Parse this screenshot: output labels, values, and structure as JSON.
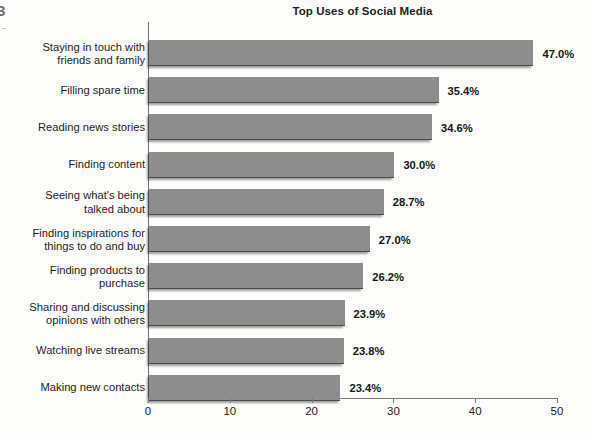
{
  "page": {
    "edge_artifact": "3",
    "background_color": "#fdfdfc"
  },
  "chart_data": {
    "type": "bar",
    "orientation": "horizontal",
    "title": "Top Uses of Social Media",
    "xlabel": "",
    "ylabel": "",
    "xlim": [
      0,
      50
    ],
    "xticks": [
      0,
      10,
      20,
      30,
      40,
      50
    ],
    "xtick_labels": [
      "0",
      "10",
      "20",
      "30",
      "40",
      "50"
    ],
    "grid": false,
    "legend": "none",
    "bar_color": "#8d8d8d",
    "value_suffix": "%",
    "categories": [
      "Staying in touch with\nfriends and family",
      "Filling spare time",
      "Reading news stories",
      "Finding content",
      "Seeing what's being\ntalked about",
      "Finding inspirations for\nthings to do and buy",
      "Finding products to\npurchase",
      "Sharing and discussing\nopinions with others",
      "Watching live streams",
      "Making new contacts"
    ],
    "values": [
      47.0,
      35.4,
      34.6,
      30.0,
      28.7,
      27.0,
      26.2,
      23.9,
      23.8,
      23.4
    ],
    "value_labels": [
      "47.0%",
      "35.4%",
      "34.6%",
      "30.0%",
      "28.7%",
      "27.0%",
      "26.2%",
      "23.9%",
      "23.8%",
      "23.4%"
    ]
  }
}
